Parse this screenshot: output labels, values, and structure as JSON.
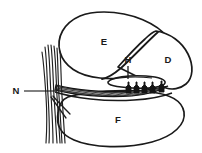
{
  "figure": {
    "type": "line-diagram",
    "background_color": "#ffffff",
    "ink_color": "#1a1a1a",
    "width": 202,
    "height": 153
  },
  "labels": [
    {
      "key": "E",
      "text": "E",
      "x": 104,
      "y": 42,
      "describes": "large upper lobe region"
    },
    {
      "key": "D",
      "text": "D",
      "x": 168,
      "y": 60,
      "describes": "right upper wedge region"
    },
    {
      "key": "H",
      "text": "H",
      "x": 126,
      "y": 62,
      "describes": "elongated structure with follicle cluster"
    },
    {
      "key": "N",
      "text": "N",
      "x": 15,
      "y": 94,
      "describes": "vertical fiber bundle"
    },
    {
      "key": "F",
      "text": "F",
      "x": 118,
      "y": 120,
      "describes": "large lower lobe region"
    }
  ],
  "leaders": [
    {
      "key": "H",
      "orientation": "vertical",
      "from_x": 128,
      "from_y": 65,
      "to_x": 128,
      "to_y": 79
    },
    {
      "key": "N",
      "orientation": "horizontal",
      "from_x": 24,
      "from_y": 91,
      "to_x": 55,
      "to_y": 91
    }
  ],
  "structures": [
    {
      "name": "upper-lobe-E",
      "shape": "large-oval"
    },
    {
      "name": "right-wedge-D",
      "shape": "rounded-wedge"
    },
    {
      "name": "lower-lobe-F",
      "shape": "large-oval"
    },
    {
      "name": "band-H",
      "shape": "elongated-oval"
    },
    {
      "name": "follicle-cluster",
      "shape": "flask-row",
      "count": 5
    },
    {
      "name": "fiber-bundle-N",
      "shape": "parallel-strands",
      "count": 7
    },
    {
      "name": "hatched-band",
      "shape": "striped-ribbon"
    }
  ]
}
